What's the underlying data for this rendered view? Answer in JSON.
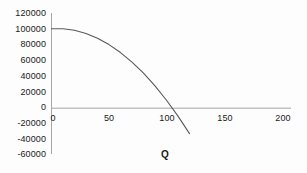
{
  "chart_data": {
    "type": "line",
    "title": "",
    "subtitle": "",
    "xlabel": "Q",
    "ylabel": "",
    "xlim": [
      0,
      200
    ],
    "ylim": [
      -60000,
      120000
    ],
    "grid": false,
    "legend": null,
    "x_ticks": [
      "0",
      "50",
      "100",
      "150",
      "200"
    ],
    "x_tick_values": [
      0,
      50,
      100,
      150,
      200
    ],
    "y_ticks": [
      "-60000",
      "-40000",
      "-20000",
      "0",
      "20000",
      "40000",
      "60000",
      "80000",
      "100000",
      "120000"
    ],
    "y_tick_values": [
      -60000,
      -40000,
      -20000,
      0,
      20000,
      40000,
      60000,
      80000,
      100000,
      120000
    ],
    "series": [
      {
        "name": "profit",
        "color": "#595959",
        "x": [
          0,
          10,
          20,
          30,
          40,
          50,
          60,
          70,
          80,
          90,
          100,
          110,
          120,
          130,
          140,
          150,
          160
        ],
        "values": [
          100000,
          100000,
          98000,
          94000,
          88000,
          80000,
          70000,
          58000,
          44000,
          28000,
          10000,
          -10000,
          -32000,
          -56000,
          -82000,
          -110000,
          -140000
        ]
      }
    ],
    "curve_note": "downward-opening parabola from (0,100000), zero crossing near Q=125, ends near Q=160",
    "axis_color": "#9a9a9a",
    "text_color": "#1a1a1a",
    "background": "#fdfdfd"
  }
}
